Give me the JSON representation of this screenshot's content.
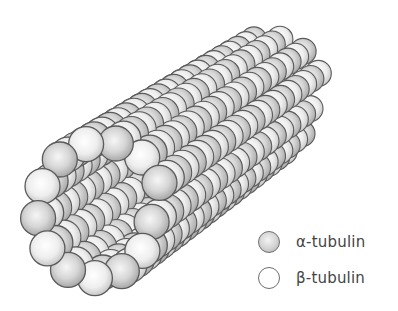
{
  "figure": {
    "protofilament_count": 13,
    "subunits_per_protofilament": 22
  },
  "legend": {
    "items": [
      {
        "key": "alpha",
        "symbol": "α",
        "label": "α-tubulin",
        "color": "#c8c8c8"
      },
      {
        "key": "beta",
        "symbol": "β",
        "label": "β-tubulin",
        "color": "#ffffff"
      }
    ]
  },
  "colors": {
    "background": "#ffffff",
    "outline": "#5a5a5a",
    "alpha_fill_light": "#f2f2f2",
    "alpha_fill_dark": "#a8a8a8",
    "beta_fill_light": "#ffffff",
    "beta_fill_dark": "#cfcfcf",
    "text": "#444444"
  },
  "geometry": {
    "front_center": [
      92,
      214
    ],
    "ring_rx": 60,
    "ring_ry": 66,
    "axis_step": [
      7.9,
      -5.35
    ],
    "sphere_r_front": 17.5,
    "sphere_r_back": 13
  }
}
